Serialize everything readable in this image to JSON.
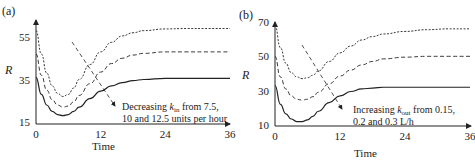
{
  "chart_data": [
    {
      "type": "line",
      "panel_label": "(a)",
      "title": "",
      "xlabel": "Time",
      "ylabel": "R",
      "xlim": [
        0,
        36
      ],
      "ylim": [
        15,
        60
      ],
      "xticks": [
        "0",
        "12",
        "24",
        "36"
      ],
      "yticks": [
        "15",
        "35",
        "55"
      ],
      "grid": false,
      "annotation": {
        "line1_prefix": "Decreasing ",
        "k": "k",
        "sub": "in",
        "line1_suffix": " from 7.5,",
        "line2": "10 and 12.5 units per hour"
      },
      "x": [
        0,
        1,
        2,
        3,
        4,
        5,
        6,
        7,
        8,
        10,
        12,
        14,
        16,
        18,
        20,
        24,
        28,
        32,
        36
      ],
      "series": [
        {
          "name": "kin = 7.5 (dotted)",
          "style": "dotted",
          "values": [
            58,
            47,
            38,
            32,
            28.5,
            27,
            28,
            31,
            35,
            42,
            48,
            52.5,
            55.5,
            57,
            58,
            58.8,
            59,
            59,
            59
          ]
        },
        {
          "name": "kin = 10 (dashed)",
          "style": "dashed",
          "values": [
            47,
            37,
            30,
            25.5,
            23,
            22,
            22.5,
            24.5,
            27.5,
            33,
            38.5,
            42.5,
            45,
            46.5,
            47.3,
            48,
            48,
            48,
            48
          ]
        },
        {
          "name": "kin = 12.5 (solid)",
          "style": "solid",
          "values": [
            36,
            28,
            23,
            20,
            18.5,
            18,
            18.5,
            20,
            22,
            26,
            29.5,
            32,
            33.5,
            34.5,
            35,
            35.5,
            35.5,
            35.5,
            35.5
          ]
        }
      ]
    },
    {
      "type": "line",
      "panel_label": "(b)",
      "title": "",
      "xlabel": "Time",
      "ylabel": "R",
      "xlim": [
        0,
        36
      ],
      "ylim": [
        10,
        70
      ],
      "xticks": [
        "0",
        "12",
        "24",
        "36"
      ],
      "yticks": [
        "10",
        "30",
        "50",
        "70"
      ],
      "grid": false,
      "annotation": {
        "line1_prefix": "Increasing ",
        "k": "k",
        "sub": "out",
        "line1_suffix": " from 0.15,",
        "line2": "0.2 and 0.3 L/h"
      },
      "x": [
        0,
        1,
        2,
        3,
        4,
        5,
        6,
        7,
        8,
        10,
        12,
        14,
        16,
        18,
        20,
        24,
        28,
        32,
        36
      ],
      "series": [
        {
          "name": "kout = 0.15 (dotted)",
          "style": "dotted",
          "values": [
            68,
            55,
            46,
            40.5,
            38,
            37,
            37.5,
            39,
            41.5,
            47,
            52,
            56,
            59.5,
            61.5,
            63,
            64.5,
            65.5,
            66,
            66
          ]
        },
        {
          "name": "kout = 0.2 (dashed)",
          "style": "dashed",
          "values": [
            50,
            38,
            31,
            27,
            25,
            24.5,
            25,
            26.5,
            29,
            34,
            38.5,
            42,
            45,
            47,
            48.5,
            49.5,
            50,
            50,
            50
          ]
        },
        {
          "name": "kout = 0.3 (solid)",
          "style": "solid",
          "values": [
            33,
            22,
            16.5,
            13.5,
            12,
            12,
            13,
            15,
            18,
            23,
            27,
            29.5,
            31,
            31.5,
            32,
            32,
            32,
            32,
            32
          ]
        }
      ]
    }
  ]
}
